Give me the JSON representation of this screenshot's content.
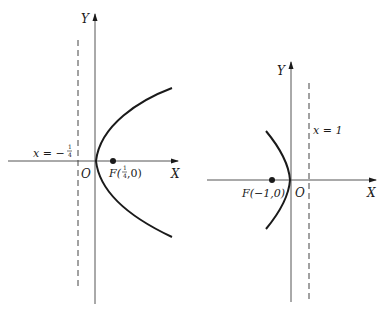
{
  "figures": [
    {
      "id": "left",
      "description": "Parabola opening right with focus F(1/4,0) and directrix x = -1/4",
      "axis_labels": {
        "x": "X",
        "y": "Y"
      },
      "origin_label": "O",
      "focus_label": {
        "prefix": "F(",
        "frac_num": "1",
        "frac_den": "4",
        "suffix": ",0)"
      },
      "directrix_label": {
        "prefix": "x = −",
        "frac_num": "1",
        "frac_den": "4"
      }
    },
    {
      "id": "right",
      "description": "Parabola opening left with focus F(-1,0) and directrix x = 1",
      "axis_labels": {
        "x": "X",
        "y": "Y"
      },
      "origin_label": "O",
      "focus_label": {
        "text": "F(−1,0)"
      },
      "directrix_label": {
        "text": "x = 1"
      }
    }
  ],
  "colors": {
    "ink": "#1a1a1a",
    "axis": "#555555",
    "background": "#ffffff"
  }
}
